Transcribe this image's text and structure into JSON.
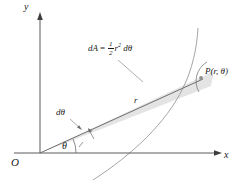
{
  "figure": {
    "kind": "polar-area-element-diagram",
    "background_color": "#ffffff",
    "axis_color": "#555555",
    "ray_color": "#6a6a6a",
    "curve_color": "#8a8a8a",
    "wedge_fill": "#e2e2e2",
    "leader_color": "#7a7a7a",
    "text_color": "#1a1a1a"
  },
  "labels": {
    "y_axis": "y",
    "x_axis": "x",
    "origin": "O",
    "theta": "θ",
    "d_theta": "dθ",
    "radius": "r",
    "point": "P(r, θ)"
  },
  "formula": {
    "lhs": "dA",
    "equals": "=",
    "numerator": "1",
    "denominator": "2",
    "radius_symbol": "r",
    "exponent": "2",
    "differential": "dθ",
    "plain_text": "dA = 1/2 r² dθ"
  },
  "geometry": {
    "origin_px": [
      40,
      153
    ],
    "y_axis_top_px": [
      40,
      14
    ],
    "x_axis_right_px": [
      222,
      153
    ],
    "point_p_px": [
      200,
      77
    ],
    "ray_angle_degrees": 22,
    "wedge_half_angle_degrees": 5,
    "angle_arc_radius_px": 34
  }
}
